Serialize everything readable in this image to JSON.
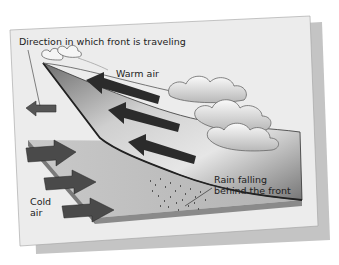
{
  "diagram": {
    "labels": {
      "direction": "Direction in which front is traveling",
      "warm_air": "Warm air",
      "cold_air_line1": "Cold",
      "cold_air_line2": "air",
      "rain_line1": "Rain falling",
      "rain_line2": "behind the front"
    },
    "colors": {
      "card": "#ececec",
      "card_shadow": "#c4c4c4",
      "ground": "#bdbdbd",
      "ground_edge": "#7a7a7a",
      "front_surface": "#a8a8a8",
      "warm_arrows": "#2b2b2b",
      "cold_arrows": "#4a4a4a",
      "direction_arrow": "#555555",
      "clouds": "#f2f2f2"
    },
    "arrows": {
      "warm_air_count": 3,
      "cold_air_count": 3,
      "direction_count": 1
    }
  }
}
